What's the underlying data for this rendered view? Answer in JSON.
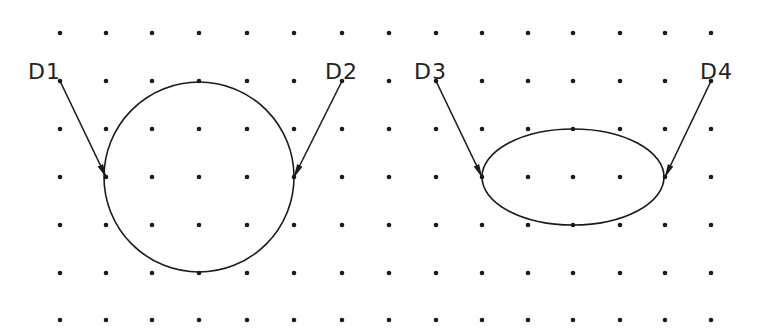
{
  "diagram": {
    "background": "#ffffff",
    "ink_color": "#1a1a1a",
    "grid": {
      "columns_x": [
        60,
        106,
        152,
        199,
        247,
        294,
        342,
        389,
        436,
        482,
        528,
        573,
        620,
        665,
        711
      ],
      "rows_y": [
        33,
        81,
        129,
        177,
        225,
        273,
        320
      ],
      "dot_radius": 2.3
    },
    "shapes": [
      {
        "id": "circle",
        "type": "circle",
        "cx": 199,
        "cy": 177,
        "r": 95
      },
      {
        "id": "ellipse",
        "type": "ellipse",
        "cx": 573,
        "cy": 177,
        "rx": 91,
        "ry": 48
      }
    ],
    "pick_points": [
      {
        "label": "D1",
        "from": [
          60,
          81
        ],
        "to": [
          106,
          177
        ],
        "label_pos": [
          28,
          79
        ]
      },
      {
        "label": "D2",
        "from": [
          342,
          81
        ],
        "to": [
          294,
          177
        ],
        "label_pos": [
          325,
          79
        ]
      },
      {
        "label": "D3",
        "from": [
          436,
          81
        ],
        "to": [
          482,
          177
        ],
        "label_pos": [
          414,
          79
        ]
      },
      {
        "label": "D4",
        "from": [
          711,
          81
        ],
        "to": [
          665,
          177
        ],
        "label_pos": [
          700,
          79
        ]
      }
    ]
  }
}
